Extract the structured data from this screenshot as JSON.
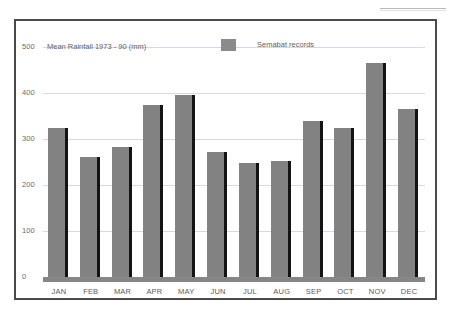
{
  "figure": {
    "title": "Mean Rainfall 1973 - 90 (mm)",
    "legend_label": "Semabat records",
    "legend_swatch_color": "#8b8b8b"
  },
  "chart_data": {
    "type": "bar",
    "title": "Mean Rainfall 1973 - 90 (mm)",
    "xlabel": "",
    "ylabel": "",
    "ylim": [
      0,
      500
    ],
    "yticks": [
      0,
      100,
      200,
      300,
      400,
      500
    ],
    "ytick_labels": [
      "0",
      "100",
      "200",
      "300",
      "400",
      "500"
    ],
    "grid": true,
    "legend_position": "top-center",
    "categories": [
      "JAN",
      "FEB",
      "MAR",
      "APR",
      "MAY",
      "JUN",
      "JUL",
      "AUG",
      "SEP",
      "OCT",
      "NOV",
      "DEC"
    ],
    "series": [
      {
        "name": "Semabat records",
        "color": "#828282",
        "values": [
          325,
          260,
          283,
          375,
          395,
          272,
          248,
          252,
          340,
          325,
          465,
          365
        ]
      }
    ]
  }
}
